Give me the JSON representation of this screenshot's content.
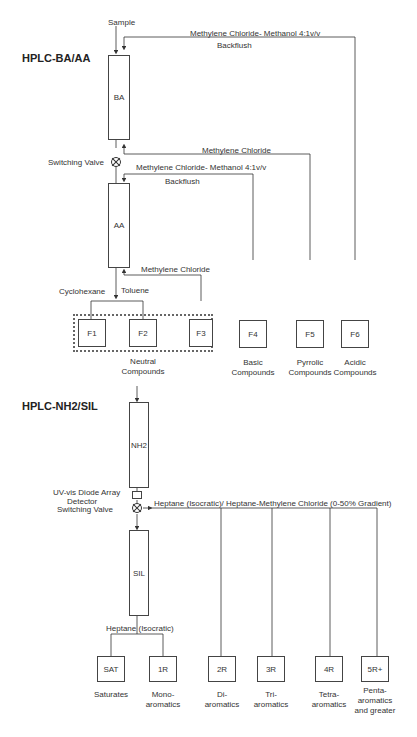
{
  "sections": {
    "ba_aa": {
      "title": "HPLC-BA/AA",
      "sample_label": "Sample",
      "columns": [
        {
          "id": "BA",
          "label": "BA"
        },
        {
          "id": "AA",
          "label": "AA"
        }
      ],
      "switching_valve_label": "Switching Valve",
      "flows": {
        "ba_backflush_solvent": "Methylene Chloride- Methanol 4:1v/v",
        "ba_backflush_label": "Backflush",
        "ba_forward_solvent": "Methylene Chloride",
        "aa_backflush_solvent": "Methylene Chloride- Methanol 4:1v/v",
        "aa_backflush_label": "Backflush",
        "aa_forward_solvent": "Methylene Chloride",
        "cyclohexane": "Cyclohexane",
        "toluene": "Toluene"
      },
      "fractions": [
        {
          "id": "F1",
          "label": "F1"
        },
        {
          "id": "F2",
          "label": "F2"
        },
        {
          "id": "F3",
          "label": "F3"
        },
        {
          "id": "F4",
          "label": "F4",
          "desc_line1": "Basic",
          "desc_line2": "Compounds"
        },
        {
          "id": "F5",
          "label": "F5",
          "desc_line1": "Pyrrolic",
          "desc_line2": "Compounds"
        },
        {
          "id": "F6",
          "label": "F6",
          "desc_line1": "Acidic",
          "desc_line2": "Compounds"
        }
      ],
      "neutral_label_line1": "Neutral",
      "neutral_label_line2": "Compounds"
    },
    "nh2_sil": {
      "title": "HPLC-NH2/SIL",
      "columns": [
        {
          "id": "NH2",
          "label": "NH2"
        },
        {
          "id": "SIL",
          "label": "SIL"
        }
      ],
      "detector_label_line1": "UV-vis Diode Array",
      "detector_label_line2": "Detector",
      "switching_valve_label": "Switching Valve",
      "gradient_solvent": "Heptane (Isocratic)/ Heptane-Methylene Chloride (0-50% Gradient)",
      "isocratic_solvent": "Heptane (Isocratic)",
      "fractions": [
        {
          "id": "SAT",
          "label": "SAT",
          "desc_line1": "Saturates",
          "desc_line2": "",
          "desc_line3": ""
        },
        {
          "id": "1R",
          "label": "1R",
          "desc_line1": "Mono-",
          "desc_line2": "aromatics",
          "desc_line3": ""
        },
        {
          "id": "2R",
          "label": "2R",
          "desc_line1": "Di-",
          "desc_line2": "aromatics",
          "desc_line3": ""
        },
        {
          "id": "3R",
          "label": "3R",
          "desc_line1": "Tri-",
          "desc_line2": "aromatics",
          "desc_line3": ""
        },
        {
          "id": "4R",
          "label": "4R",
          "desc_line1": "Tetra-",
          "desc_line2": "aromatics",
          "desc_line3": ""
        },
        {
          "id": "5R+",
          "label": "5R+",
          "desc_line1": "Penta-",
          "desc_line2": "aromatics",
          "desc_line3": "and greater"
        }
      ]
    }
  },
  "colors": {
    "line": "#333333",
    "background": "#ffffff",
    "text": "#222222"
  }
}
